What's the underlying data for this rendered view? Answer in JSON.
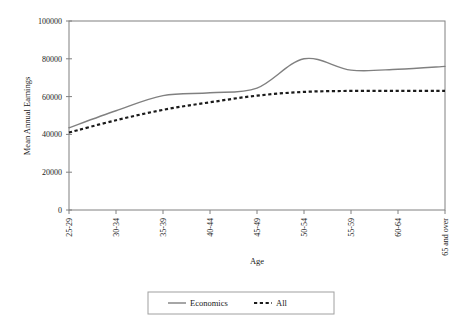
{
  "chart_data": {
    "type": "line",
    "title": "",
    "xlabel": "Age",
    "ylabel": "Mean Annual Earnings",
    "categories": [
      "25-29",
      "30-34",
      "35-39",
      "40-44",
      "45-49",
      "50-54",
      "55-59",
      "60-64",
      "65 and over"
    ],
    "ylim": [
      0,
      100000
    ],
    "yticks": [
      0,
      20000,
      40000,
      60000,
      80000,
      100000
    ],
    "ytick_labels": [
      "0",
      "20000",
      "40000",
      "60000",
      "80000",
      "100000"
    ],
    "grid": false,
    "legend_position": "bottom",
    "series": [
      {
        "name": "Economics",
        "style": "solid",
        "color": "#808080",
        "values": [
          43500,
          52500,
          60500,
          62000,
          64500,
          80000,
          74000,
          74500,
          76000
        ]
      },
      {
        "name": "All",
        "style": "dashed",
        "color": "#1a1a1a",
        "values": [
          41000,
          47500,
          53000,
          57000,
          60500,
          62500,
          63000,
          63000,
          63000
        ]
      }
    ]
  },
  "axis": {
    "y_title": "Mean Annual Earnings",
    "x_title": "Age"
  },
  "legend": {
    "items": [
      {
        "label": "Economics",
        "style": "solid",
        "color": "#808080"
      },
      {
        "label": "All",
        "style": "dashed",
        "color": "#1a1a1a"
      }
    ]
  },
  "colors": {
    "economics_line": "#808080",
    "all_line": "#1a1a1a",
    "axis": "#808080",
    "legend_border": "#a0a0a0"
  }
}
